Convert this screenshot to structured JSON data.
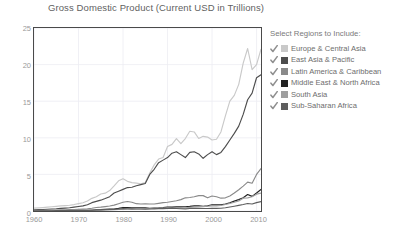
{
  "chart_data": {
    "type": "line",
    "title": "Gross Domestic Product (Current USD in Trillions)",
    "xlabel": "",
    "ylabel": "",
    "xlim": [
      1960,
      2011
    ],
    "ylim": [
      0,
      25
    ],
    "xticks": [
      "1960",
      "1970",
      "1980",
      "1990",
      "2000",
      "2010"
    ],
    "xtick_values": [
      1960,
      1970,
      1980,
      1990,
      2000,
      2010
    ],
    "yticks": [
      "0",
      "5",
      "10",
      "15",
      "20",
      "25"
    ],
    "ytick_values": [
      0,
      5,
      10,
      15,
      20,
      25
    ],
    "grid": true,
    "legend_position": "right",
    "x": [
      1960,
      1961,
      1962,
      1963,
      1964,
      1965,
      1966,
      1967,
      1968,
      1969,
      1970,
      1971,
      1972,
      1973,
      1974,
      1975,
      1976,
      1977,
      1978,
      1979,
      1980,
      1981,
      1982,
      1983,
      1984,
      1985,
      1986,
      1987,
      1988,
      1989,
      1990,
      1991,
      1992,
      1993,
      1994,
      1995,
      1996,
      1997,
      1998,
      1999,
      2000,
      2001,
      2002,
      2003,
      2004,
      2005,
      2006,
      2007,
      2008,
      2009,
      2010,
      2011
    ],
    "series": [
      {
        "name": "Europe & Central Asia",
        "color": "#c9c9c9",
        "values": [
          0.4,
          0.43,
          0.47,
          0.52,
          0.58,
          0.63,
          0.69,
          0.74,
          0.78,
          0.88,
          1.0,
          1.13,
          1.36,
          1.73,
          1.94,
          2.32,
          2.44,
          2.79,
          3.43,
          4.13,
          4.4,
          4.05,
          3.88,
          3.8,
          3.7,
          3.9,
          5.2,
          6.3,
          7.1,
          7.3,
          8.8,
          9.1,
          9.9,
          9.2,
          9.9,
          10.9,
          10.8,
          9.9,
          10.2,
          10.1,
          9.7,
          9.8,
          10.8,
          13.0,
          15.0,
          15.8,
          17.3,
          20.2,
          22.2,
          19.3,
          20.0,
          22.1
        ]
      },
      {
        "name": "East Asia & Pacific",
        "color": "#4d4d4d",
        "values": [
          0.17,
          0.19,
          0.21,
          0.24,
          0.28,
          0.31,
          0.36,
          0.4,
          0.45,
          0.53,
          0.62,
          0.7,
          0.86,
          1.14,
          1.32,
          1.48,
          1.7,
          1.96,
          2.45,
          2.7,
          2.95,
          3.2,
          3.25,
          3.45,
          3.6,
          3.75,
          5.0,
          5.7,
          6.6,
          6.95,
          7.3,
          7.9,
          8.1,
          7.7,
          7.3,
          8.0,
          8.1,
          7.8,
          7.2,
          7.7,
          8.1,
          7.7,
          8.0,
          8.8,
          9.7,
          10.6,
          11.6,
          13.2,
          15.2,
          16.1,
          18.2,
          18.6
        ]
      },
      {
        "name": "Latin America & Caribbean",
        "color": "#8a8a8a",
        "values": [
          0.08,
          0.09,
          0.1,
          0.1,
          0.12,
          0.13,
          0.15,
          0.16,
          0.18,
          0.2,
          0.22,
          0.25,
          0.29,
          0.37,
          0.48,
          0.53,
          0.6,
          0.68,
          0.8,
          1.0,
          1.2,
          1.3,
          1.2,
          1.0,
          0.95,
          0.98,
          0.95,
          0.95,
          1.05,
          1.15,
          1.2,
          1.3,
          1.4,
          1.55,
          1.8,
          1.85,
          1.95,
          2.1,
          2.1,
          1.8,
          2.05,
          1.95,
          1.75,
          1.8,
          2.05,
          2.45,
          2.9,
          3.4,
          3.95,
          3.8,
          5.0,
          5.8
        ]
      },
      {
        "name": "Middle East & North Africa",
        "color": "#222222",
        "values": [
          0.01,
          0.01,
          0.01,
          0.02,
          0.02,
          0.02,
          0.02,
          0.02,
          0.03,
          0.03,
          0.04,
          0.05,
          0.06,
          0.08,
          0.16,
          0.18,
          0.22,
          0.25,
          0.27,
          0.36,
          0.48,
          0.48,
          0.45,
          0.45,
          0.44,
          0.44,
          0.38,
          0.4,
          0.42,
          0.46,
          0.53,
          0.52,
          0.56,
          0.56,
          0.58,
          0.63,
          0.7,
          0.72,
          0.64,
          0.71,
          0.85,
          0.84,
          0.86,
          0.96,
          1.12,
          1.35,
          1.55,
          1.8,
          2.25,
          2.0,
          2.45,
          2.95
        ]
      },
      {
        "name": "South Asia",
        "color": "#9f9f9f",
        "values": [
          0.05,
          0.05,
          0.05,
          0.06,
          0.07,
          0.07,
          0.06,
          0.07,
          0.07,
          0.08,
          0.09,
          0.09,
          0.09,
          0.11,
          0.13,
          0.14,
          0.14,
          0.16,
          0.19,
          0.2,
          0.23,
          0.25,
          0.26,
          0.28,
          0.28,
          0.31,
          0.33,
          0.37,
          0.4,
          0.4,
          0.43,
          0.38,
          0.37,
          0.38,
          0.44,
          0.5,
          0.55,
          0.59,
          0.6,
          0.65,
          0.69,
          0.71,
          0.75,
          0.88,
          1.03,
          1.2,
          1.38,
          1.75,
          1.8,
          1.95,
          2.3,
          2.45
        ]
      },
      {
        "name": "Sub-Saharan Africa",
        "color": "#5e5e5e",
        "values": [
          0.03,
          0.03,
          0.03,
          0.04,
          0.04,
          0.05,
          0.05,
          0.05,
          0.05,
          0.06,
          0.07,
          0.08,
          0.09,
          0.11,
          0.15,
          0.16,
          0.17,
          0.2,
          0.22,
          0.27,
          0.32,
          0.31,
          0.29,
          0.28,
          0.27,
          0.26,
          0.27,
          0.3,
          0.32,
          0.33,
          0.35,
          0.34,
          0.34,
          0.31,
          0.3,
          0.34,
          0.35,
          0.36,
          0.34,
          0.34,
          0.36,
          0.35,
          0.37,
          0.45,
          0.55,
          0.65,
          0.76,
          0.88,
          1.02,
          0.96,
          1.15,
          1.28
        ]
      }
    ]
  },
  "legend": {
    "title": "Select Regions to Include:",
    "items": [
      {
        "label": "Europe & Central Asia",
        "color": "#c9c9c9",
        "checked": true,
        "checkbox_icon": "checkbox-checked-icon"
      },
      {
        "label": "East Asia & Pacific",
        "color": "#4d4d4d",
        "checked": true,
        "checkbox_icon": "checkbox-checked-icon"
      },
      {
        "label": "Latin America & Caribbean",
        "color": "#8a8a8a",
        "checked": true,
        "checkbox_icon": "checkbox-checked-icon"
      },
      {
        "label": "Middle East & North Africa",
        "color": "#222222",
        "checked": true,
        "checkbox_icon": "checkbox-checked-icon"
      },
      {
        "label": "South Asia",
        "color": "#9f9f9f",
        "checked": true,
        "checkbox_icon": "checkbox-checked-icon"
      },
      {
        "label": "Sub-Saharan Africa",
        "color": "#5e5e5e",
        "checked": true,
        "checkbox_icon": "checkbox-checked-icon"
      }
    ]
  },
  "colors": {
    "axis": "#4a4a4a",
    "grid": "#ececf2",
    "tick_text": "#9a9a9a",
    "title_text": "#5f5f5f",
    "legend_text": "#6d6d6d",
    "background": "#ffffff"
  }
}
